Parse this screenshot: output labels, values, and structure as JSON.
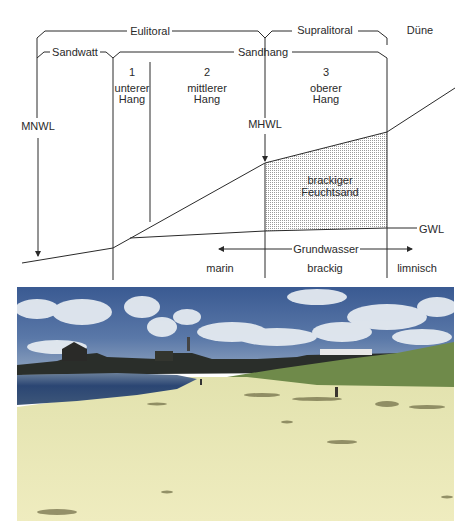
{
  "diagram": {
    "zones_top": {
      "eulitoral": "Eulitoral",
      "supralitoral": "Supralitoral",
      "duene": "Düne"
    },
    "zones_second": {
      "sandwatt": "Sandwatt",
      "sandhang": "Sandhang"
    },
    "slope_sections": [
      {
        "number": "1",
        "line1": "unterer",
        "line2": "Hang"
      },
      {
        "number": "2",
        "line1": "mittlerer",
        "line2": "Hang"
      },
      {
        "number": "3",
        "line1": "oberer",
        "line2": "Hang"
      }
    ],
    "levels": {
      "mnwl": "MNWL",
      "mhwl": "MHWL",
      "gwl": "GWL"
    },
    "shaded_area": {
      "line1": "brackiger",
      "line2": "Feuchtsand"
    },
    "groundwater": {
      "label": "Grundwasser",
      "types": [
        "marin",
        "brackig",
        "limnisch"
      ]
    }
  },
  "photo": {
    "subject": "beach-landscape",
    "colors": {
      "sky": "#3d5a8c",
      "clouds": "#e8edf2",
      "water": "#2c4670",
      "sand": "#ece9b6",
      "dune_grass": "#6f8a4a"
    }
  }
}
